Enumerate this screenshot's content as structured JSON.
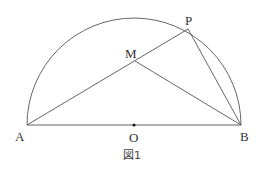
{
  "figure": {
    "caption": "図1",
    "points": {
      "A": {
        "label": "A",
        "x": 27,
        "y": 125
      },
      "B": {
        "label": "B",
        "x": 241,
        "y": 125
      },
      "O": {
        "label": "O",
        "x": 134,
        "y": 125
      },
      "P": {
        "label": "P",
        "x": 188,
        "y": 29
      },
      "M": {
        "label": "M",
        "x": 135,
        "y": 61
      }
    },
    "semicircle": {
      "center": "O",
      "radius": 107,
      "diameter": "AB"
    },
    "segments": [
      "AB",
      "AP",
      "PB",
      "MB"
    ],
    "stroke_color": "#555555"
  }
}
